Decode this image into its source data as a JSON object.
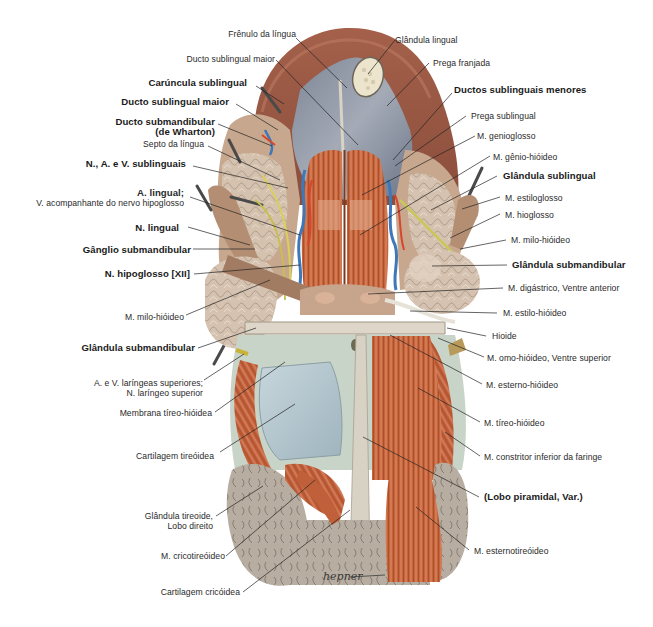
{
  "figure": {
    "signature": "hepner",
    "colors": {
      "muscle": "#c0633c",
      "muscle_dark": "#8f3f22",
      "tongue": "#9a5440",
      "mucosa": "#8e96a6",
      "gland": "#d8c6b4",
      "cartilage": "#b9ccd3",
      "thyroid": "#b7aca0",
      "artery": "#d8452a",
      "vein": "#3f78b8",
      "nerve": "#d9d05a",
      "bone": "#d9d4c8",
      "leader": "#222222"
    }
  },
  "labels_left": [
    {
      "id": "frenulo",
      "text": "Frênulo da língua",
      "bold": false
    },
    {
      "id": "ducto-sublingual-maior-top",
      "text": "Ducto sublingual maior",
      "bold": false
    },
    {
      "id": "caruncula",
      "text": "Carúncula sublingual",
      "bold": true
    },
    {
      "id": "ducto-sublingual-maior",
      "text": "Ducto sublingual maior",
      "bold": true
    },
    {
      "id": "ducto-submandibular",
      "text": "Ducto submandibular",
      "text2": "(de Wharton)",
      "bold": true
    },
    {
      "id": "septo",
      "text": "Septo da língua",
      "bold": false
    },
    {
      "id": "nav-sublinguais",
      "text": "N., A. e V. sublinguais",
      "bold": true
    },
    {
      "id": "a-lingual",
      "text": "A. lingual;",
      "text2": "V. acompanhante do nervo hipoglosso",
      "bold": true
    },
    {
      "id": "n-lingual",
      "text": "N. lingual",
      "bold": true
    },
    {
      "id": "ganglio",
      "text": "Gânglio submandibular",
      "bold": true
    },
    {
      "id": "n-hipoglosso",
      "text": "N. hipoglosso [XII]",
      "bold": true
    },
    {
      "id": "milo-hioideo-l",
      "text": "M. milo-hióideo",
      "bold": false
    },
    {
      "id": "glandula-submandibular-l",
      "text": "Glândula submandibular",
      "bold": true
    },
    {
      "id": "laringeas",
      "text": "A. e V. laríngeas superiores;",
      "text2": "N. laríngeo superior",
      "bold": false
    },
    {
      "id": "membrana",
      "text": "Membrana tíreo-hióidea",
      "bold": false
    },
    {
      "id": "cart-tireoidea",
      "text": "Cartilagem tireóidea",
      "bold": false
    },
    {
      "id": "tireoide",
      "text": "Glândula tireoide,",
      "text2": "Lobo direito",
      "bold": false
    },
    {
      "id": "cricotireoideo",
      "text": "M. cricotireóideo",
      "bold": false
    },
    {
      "id": "cart-cricoidea",
      "text": "Cartilagem cricóidea",
      "bold": false
    }
  ],
  "labels_right": [
    {
      "id": "glandula-lingual",
      "text": "Glândula lingual",
      "bold": false
    },
    {
      "id": "prega-franjada",
      "text": "Prega franjada",
      "bold": false
    },
    {
      "id": "ductos-menores",
      "text": "Ductos sublinguais menores",
      "bold": true
    },
    {
      "id": "prega-sublingual",
      "text": "Prega sublingual",
      "bold": false
    },
    {
      "id": "genioglosso",
      "text": "M. genioglosso",
      "bold": false
    },
    {
      "id": "genio-hioideo",
      "text": "M. gênio-hióideo",
      "bold": false
    },
    {
      "id": "glandula-sublingual",
      "text": "Glândula sublingual",
      "bold": true
    },
    {
      "id": "estiloglosso",
      "text": "M. estiloglosso",
      "bold": false
    },
    {
      "id": "hioglosso",
      "text": "M. hioglosso",
      "bold": false
    },
    {
      "id": "milo-hioideo-r",
      "text": "M. milo-hióideo",
      "bold": false
    },
    {
      "id": "glandula-submandibular-r",
      "text": "Glândula submandibular",
      "bold": true
    },
    {
      "id": "digastrico",
      "text": "M. digástrico, Ventre anterior",
      "bold": false
    },
    {
      "id": "estilo-hioideo",
      "text": "M. estilo-hióideo",
      "bold": false
    },
    {
      "id": "hioide",
      "text": "Hioide",
      "bold": false
    },
    {
      "id": "omo-hioideo",
      "text": "M. omo-hióideo, Ventre superior",
      "bold": false
    },
    {
      "id": "esterno-hioideo",
      "text": "M. esterno-hióideo",
      "bold": false
    },
    {
      "id": "tireo-hioideo",
      "text": "M. tíreo-hióideo",
      "bold": false
    },
    {
      "id": "constritor",
      "text": "M. constritor inferior da faringe",
      "bold": false
    },
    {
      "id": "lobo-piramidal",
      "text": "(Lobo piramidal, Var.)",
      "bold": true
    },
    {
      "id": "esternotireoideo",
      "text": "M. esternotireóideo",
      "bold": false
    }
  ]
}
